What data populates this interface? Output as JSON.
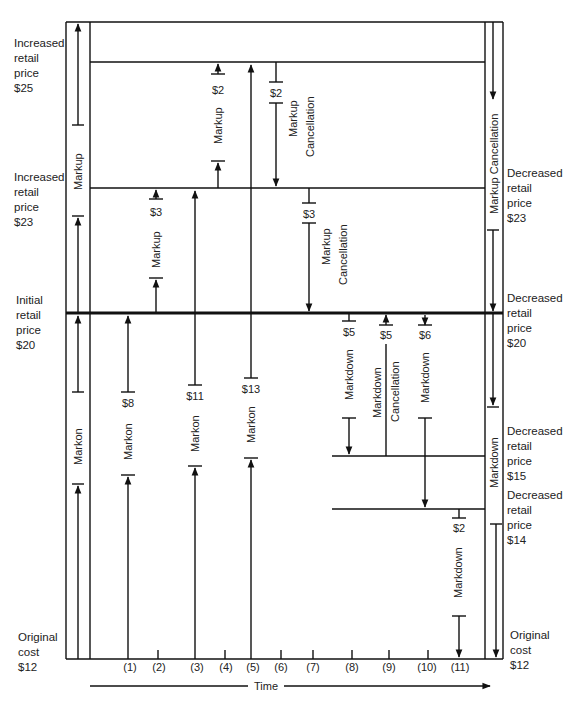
{
  "left_labels": [
    {
      "text": "Increased\nretail\nprice\n$25",
      "x": 14,
      "y": 36
    },
    {
      "text": "Increased\nretail\nprice\n$23",
      "x": 14,
      "y": 170
    },
    {
      "text": "Initial\nretail\nprice\n$20",
      "x": 16,
      "y": 293
    },
    {
      "text": "Original\ncost\n$12",
      "x": 18,
      "y": 630
    }
  ],
  "right_labels": [
    {
      "text": "Decreased\nretail\nprice\n$23",
      "x": 507,
      "y": 170
    },
    {
      "text": "Decreased\nretail\nprice\n$20",
      "x": 507,
      "y": 295
    },
    {
      "text": "Decreased\nretail\nprice\n$15",
      "x": 507,
      "y": 424
    },
    {
      "text": "Decreased\nretail\nprice\n$14",
      "x": 507,
      "y": 488
    },
    {
      "text": "Original\ncost\n$12",
      "x": 510,
      "y": 628
    }
  ],
  "price_levels": {
    "p25": "$25",
    "p23": "$23",
    "p20": "$20",
    "p15": "$15",
    "p14": "$14",
    "p12": "$12"
  },
  "vertical_labels": {
    "left_markup": "Markup",
    "left_markon": "Markon",
    "col1_markon": "Markon",
    "col3_markon": "Markon",
    "col5_markon": "Markon",
    "col2_markup": "Markup",
    "col4_markup": "Markup",
    "col6_markup": "Markup",
    "col6_cancel": "Cancellation",
    "col7_markup": "Markup",
    "col7_cancel": "Cancellation",
    "col8_markdown": "Markdown",
    "col9_markdown": "Markdown",
    "col9_cancel": "Cancellation",
    "col10_markdown": "Markdown",
    "col11_markdown": "Markdown",
    "right_markup_cancel": "Markup  Cancellation",
    "right_markdown": "Markdown"
  },
  "amounts": {
    "col1": "$8",
    "col2": "$3",
    "col3": "$11",
    "col4": "$2",
    "col5": "$13",
    "col6": "$2",
    "col7": "$3",
    "col8": "$5",
    "col9": "$5",
    "col10": "$6",
    "col11": "$2"
  },
  "time_axis": {
    "label": "Time",
    "ticks": [
      "(1)",
      "(2)",
      "(3)",
      "(4)",
      "(5)",
      "(6)",
      "(7)",
      "(8)",
      "(9)",
      "(10)",
      "(11)"
    ]
  }
}
